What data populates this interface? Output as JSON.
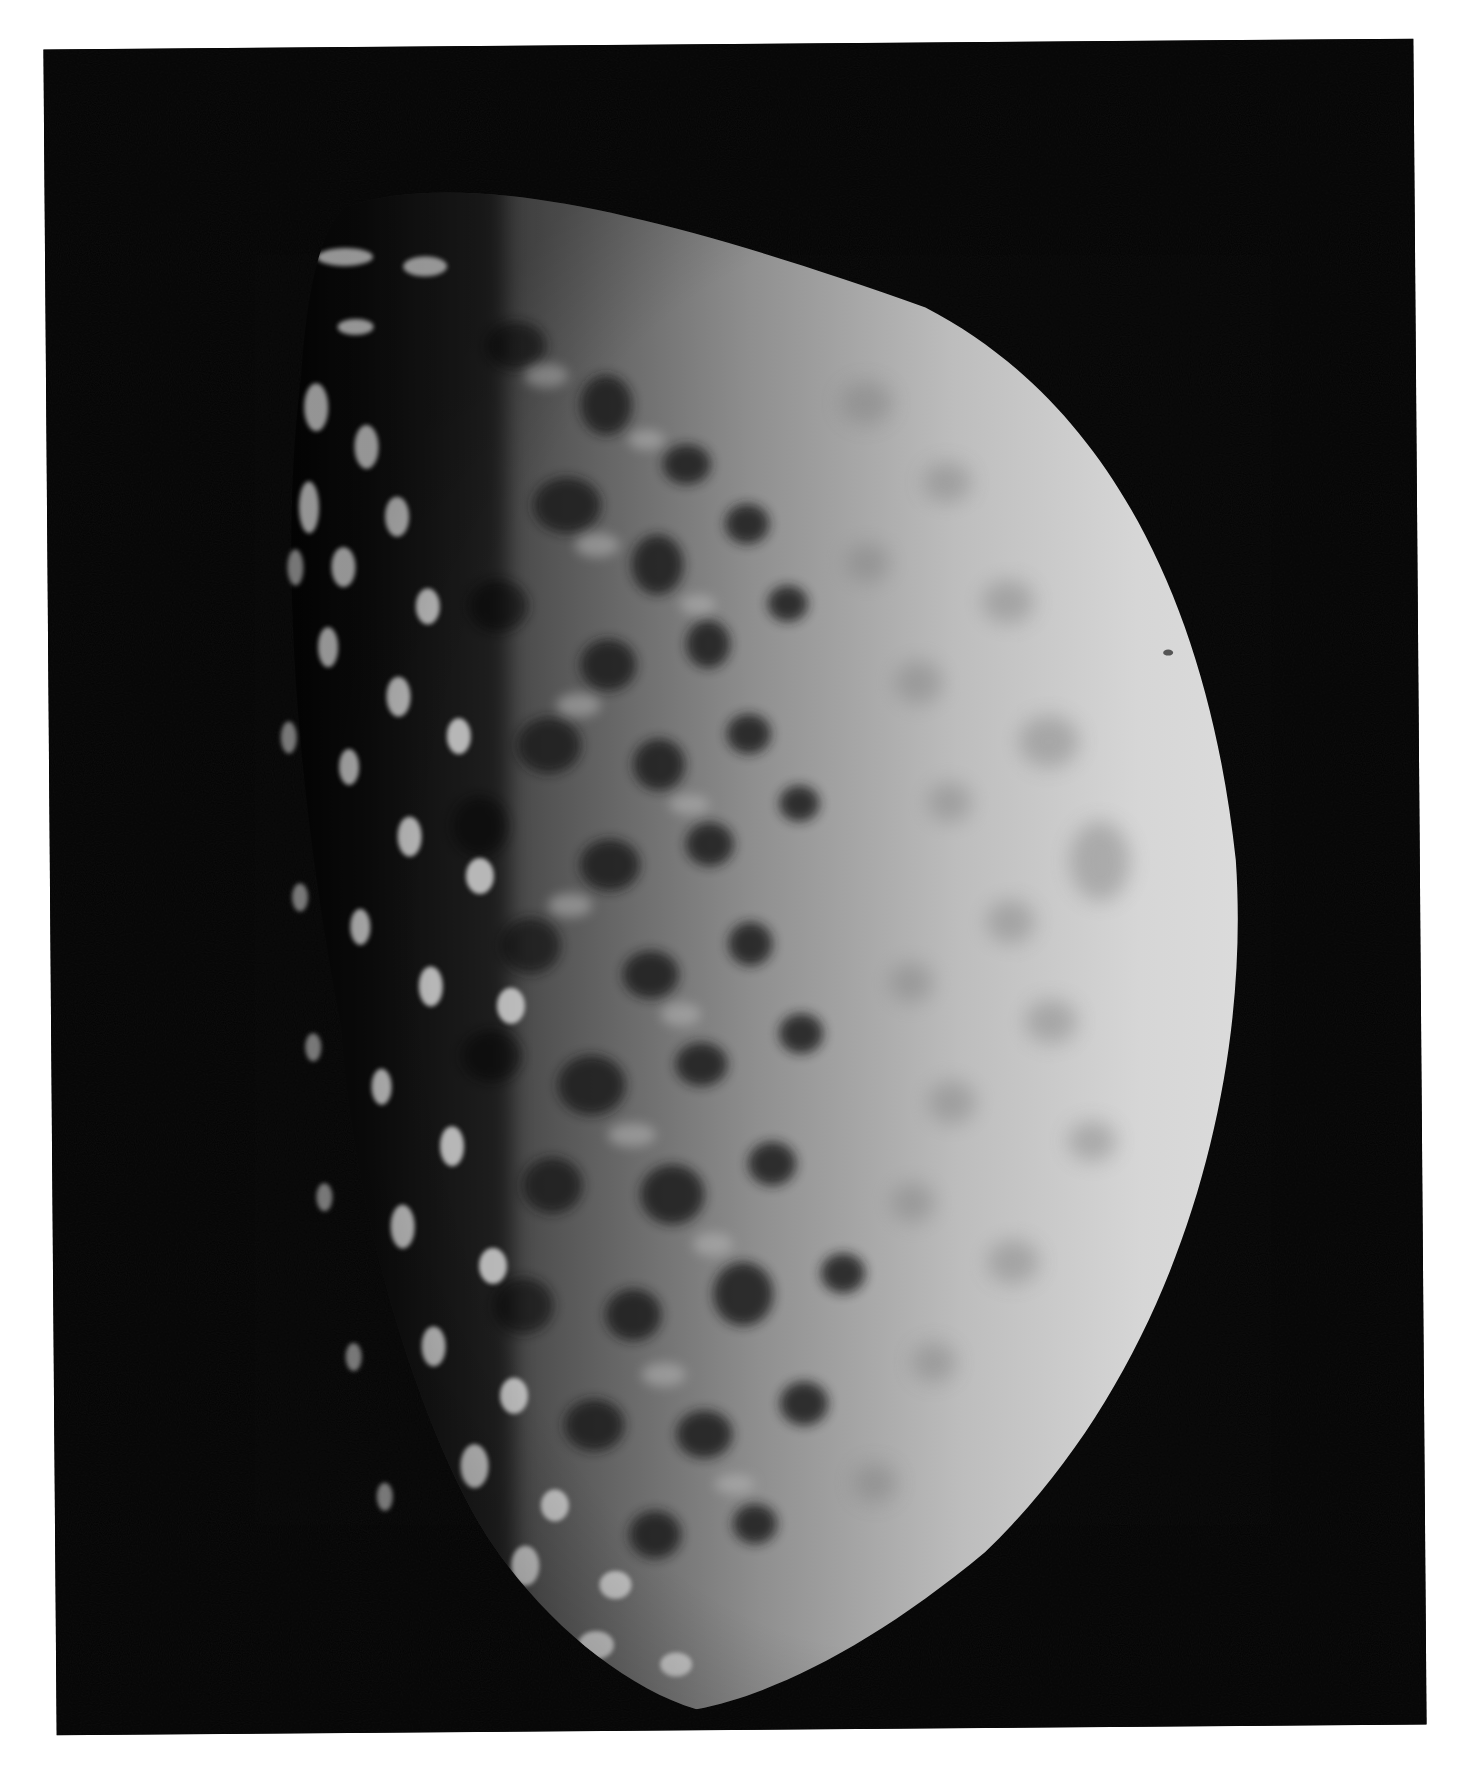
{
  "image": {
    "subject": "Half-lit heavily cratered moon against black space",
    "palette": {
      "page_background": "#ffffff",
      "space": "#020202",
      "surface_bright": "#d9d9d9",
      "surface_mid": "#9a9a9a",
      "surface_dark": "#2a2a2a",
      "crater_shadow": "#111111"
    },
    "alt_text": "Black-and-white photograph of a heavily cratered moon, illuminated from the right, with the terminator on the left showing crater rims in high relief."
  }
}
